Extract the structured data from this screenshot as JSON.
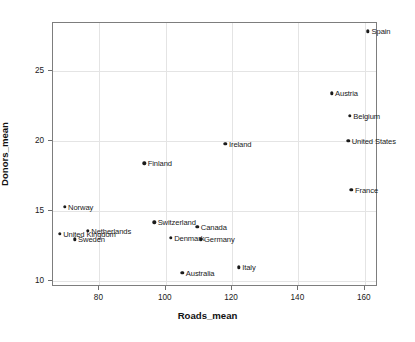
{
  "chart_data": {
    "type": "scatter",
    "title": "",
    "xlabel": "Roads_mean",
    "ylabel": "Donors_mean",
    "xlim": [
      66,
      164
    ],
    "ylim": [
      9.6,
      28.4
    ],
    "xticks": [
      80,
      100,
      120,
      140,
      160
    ],
    "xtick_labels": [
      "80",
      "100",
      "120",
      "140",
      "160"
    ],
    "yticks": [
      10,
      15,
      20,
      25
    ],
    "ytick_labels": [
      "10",
      "15",
      "20",
      "25"
    ],
    "grid": true,
    "legend": "none",
    "marker_color": "#1b1b1b",
    "grid_color": "#e4e4e4",
    "frame_color": "#7d7d7d",
    "points": [
      {
        "label": "Spain",
        "x": 161.0,
        "y": 27.8,
        "label_side": "right"
      },
      {
        "label": "Austria",
        "x": 150.0,
        "y": 23.4,
        "label_side": "right"
      },
      {
        "label": "Belgium",
        "x": 155.5,
        "y": 21.8,
        "label_side": "right"
      },
      {
        "label": "United States",
        "x": 155.0,
        "y": 20.0,
        "label_side": "right"
      },
      {
        "label": "Ireland",
        "x": 118.0,
        "y": 19.8,
        "label_side": "right"
      },
      {
        "label": "Finland",
        "x": 93.5,
        "y": 18.4,
        "label_side": "right"
      },
      {
        "label": "France",
        "x": 156.0,
        "y": 16.5,
        "label_side": "right"
      },
      {
        "label": "Norway",
        "x": 69.5,
        "y": 15.3,
        "label_side": "right"
      },
      {
        "label": "Switzerland",
        "x": 96.5,
        "y": 14.2,
        "label_side": "right"
      },
      {
        "label": "Canada",
        "x": 109.5,
        "y": 13.9,
        "label_side": "right"
      },
      {
        "label": "Netherlands",
        "x": 76.5,
        "y": 13.6,
        "label_side": "right"
      },
      {
        "label": "United Kingdom",
        "x": 68.0,
        "y": 13.4,
        "label_side": "right"
      },
      {
        "label": "Sweden",
        "x": 72.5,
        "y": 13.0,
        "label_side": "right"
      },
      {
        "label": "Denmark",
        "x": 101.5,
        "y": 13.1,
        "label_side": "right"
      },
      {
        "label": "Germany",
        "x": 110.5,
        "y": 13.0,
        "label_side": "right"
      },
      {
        "label": "Italy",
        "x": 122.0,
        "y": 11.0,
        "label_side": "right"
      },
      {
        "label": "Australia",
        "x": 105.0,
        "y": 10.6,
        "label_side": "right"
      }
    ]
  }
}
